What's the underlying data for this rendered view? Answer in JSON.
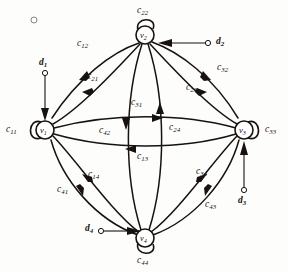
{
  "figure": {
    "type": "directed-graph-diagram",
    "background_color": "#fdfdfc",
    "ink_color": "#17120f"
  },
  "nodes": [
    {
      "id": "v1",
      "label": "v",
      "sub": "1",
      "cx": 45,
      "cy": 130,
      "r": 9
    },
    {
      "id": "v2",
      "label": "v",
      "sub": "2",
      "cx": 145,
      "cy": 35,
      "r": 9
    },
    {
      "id": "v3",
      "label": "v",
      "sub": "3",
      "cx": 244,
      "cy": 130,
      "r": 9
    },
    {
      "id": "v4",
      "label": "v",
      "sub": "4",
      "cx": 145,
      "cy": 238,
      "r": 9
    }
  ],
  "self_loops": [
    {
      "id": "c11",
      "label": "c",
      "sub": "11",
      "node": "v1",
      "side": "left"
    },
    {
      "id": "c22",
      "label": "c",
      "sub": "22",
      "node": "v2",
      "side": "top"
    },
    {
      "id": "c33",
      "label": "c",
      "sub": "33",
      "node": "v3",
      "side": "right"
    },
    {
      "id": "c44",
      "label": "c",
      "sub": "44",
      "node": "v4",
      "side": "bottom"
    }
  ],
  "inputs": [
    {
      "id": "d1",
      "label": "d",
      "sub": "1",
      "target": "v1",
      "direction": "down"
    },
    {
      "id": "d2",
      "label": "d",
      "sub": "2",
      "target": "v2",
      "direction": "left"
    },
    {
      "id": "d3",
      "label": "d",
      "sub": "3",
      "target": "v3",
      "direction": "up"
    },
    {
      "id": "d4",
      "label": "d",
      "sub": "4",
      "target": "v4",
      "direction": "right"
    }
  ],
  "edges": [
    {
      "id": "c12",
      "label": "c",
      "sub": "12",
      "from": "v2",
      "to": "v1",
      "path": "outer-arc",
      "quadrant": "upper-left"
    },
    {
      "id": "c21",
      "label": "c",
      "sub": "21",
      "from": "v1",
      "to": "v2",
      "path": "inner-chord",
      "quadrant": "upper-left"
    },
    {
      "id": "c32",
      "label": "c",
      "sub": "32",
      "from": "v2",
      "to": "v3",
      "path": "outer-arc",
      "quadrant": "upper-right"
    },
    {
      "id": "c23",
      "label": "c",
      "sub": "23",
      "from": "v3",
      "to": "v2",
      "path": "inner-chord",
      "quadrant": "upper-right"
    },
    {
      "id": "c41",
      "label": "c",
      "sub": "41",
      "from": "v1",
      "to": "v4",
      "path": "outer-arc",
      "quadrant": "lower-left"
    },
    {
      "id": "c14",
      "label": "c",
      "sub": "14",
      "from": "v4",
      "to": "v1",
      "path": "inner-chord",
      "quadrant": "lower-left"
    },
    {
      "id": "c43",
      "label": "c",
      "sub": "43",
      "from": "v3",
      "to": "v4",
      "path": "outer-arc",
      "quadrant": "lower-right"
    },
    {
      "id": "c34",
      "label": "c",
      "sub": "34",
      "from": "v4",
      "to": "v3",
      "path": "inner-chord",
      "quadrant": "lower-right"
    },
    {
      "id": "c31",
      "label": "c",
      "sub": "31",
      "from": "v1",
      "to": "v3",
      "path": "horizontal-upper",
      "quadrant": "center"
    },
    {
      "id": "c13",
      "label": "c",
      "sub": "13",
      "from": "v3",
      "to": "v1",
      "path": "horizontal-lower",
      "quadrant": "center"
    },
    {
      "id": "c42",
      "label": "c",
      "sub": "42",
      "from": "v2",
      "to": "v4",
      "path": "vertical-left",
      "quadrant": "center"
    },
    {
      "id": "c24",
      "label": "c",
      "sub": "24",
      "from": "v4",
      "to": "v2",
      "path": "vertical-right",
      "quadrant": "center"
    }
  ],
  "marks": [
    {
      "id": "stray-circle",
      "cx": 34,
      "cy": 20,
      "r": 3
    }
  ]
}
